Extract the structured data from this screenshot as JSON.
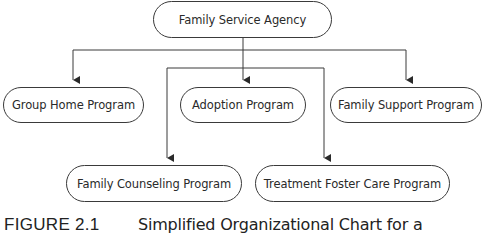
{
  "diagram": {
    "type": "organizational-chart",
    "root": {
      "label": "Family Service Agency"
    },
    "level1": [
      {
        "label": "Group Home Program"
      },
      {
        "label": "Adoption Program"
      },
      {
        "label": "Family Support Program"
      }
    ],
    "level2": [
      {
        "label": "Family Counseling Program"
      },
      {
        "label": "Treatment Foster Care Program"
      }
    ],
    "edges": [
      {
        "from": "Family Service Agency",
        "to": "Group Home Program"
      },
      {
        "from": "Family Service Agency",
        "to": "Adoption Program"
      },
      {
        "from": "Family Service Agency",
        "to": "Family Support Program"
      },
      {
        "from": "Family Service Agency",
        "to": "Family Counseling Program"
      },
      {
        "from": "Family Service Agency",
        "to": "Treatment Foster Care Program"
      }
    ],
    "line_color": "#3a3a3a"
  },
  "caption": {
    "label": "FIGURE 2.1",
    "text": "Simplified Organizational Chart for a"
  }
}
